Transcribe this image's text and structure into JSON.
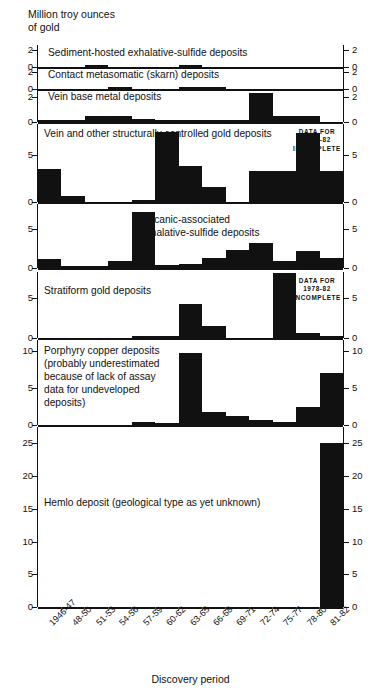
{
  "header": {
    "axis_title": "Million troy ounces\nof gold"
  },
  "xaxis": {
    "title": "Discovery period",
    "categories": [
      "1946-47",
      "48-50",
      "51-53",
      "54-56",
      "57-59",
      "60-62",
      "63-65",
      "66-68",
      "69-71",
      "72-74",
      "75-77",
      "78-80",
      "81-82"
    ]
  },
  "notes": {
    "incomplete": "DATA FOR\n1978-82\nINCOMPLETE"
  },
  "chart_data": {
    "type": "bar",
    "xlabel": "Discovery period",
    "ylabel": "Million troy ounces of gold",
    "grid": false,
    "legend": "none",
    "categories": [
      "1946-47",
      "48-50",
      "51-53",
      "54-56",
      "57-59",
      "60-62",
      "63-65",
      "66-68",
      "69-71",
      "72-74",
      "75-77",
      "78-80",
      "81-82"
    ],
    "panels": [
      {
        "name": "sediment-hosted",
        "label": "Sediment-hosted exhalative-sulfide deposits",
        "ylim": [
          0,
          2.6
        ],
        "yticks": [
          0,
          2
        ],
        "values": [
          0,
          0,
          0.12,
          0,
          0,
          0,
          0.2,
          0,
          0,
          0,
          0,
          0,
          0
        ],
        "incomplete_note": false
      },
      {
        "name": "contact-metasomatic",
        "label": "Contact metasomatic (skarn) deposits",
        "ylim": [
          0,
          2.6
        ],
        "yticks": [
          0,
          2
        ],
        "values": [
          0,
          0,
          0,
          0.2,
          0,
          0,
          0.06,
          0.06,
          0,
          0,
          0,
          0,
          0
        ],
        "incomplete_note": false
      },
      {
        "name": "vein-base-metal",
        "label": "Vein base metal deposits",
        "ylim": [
          0,
          2.6
        ],
        "yticks": [
          0,
          2
        ],
        "values": [
          0.05,
          0.1,
          0.45,
          0.45,
          0.2,
          0.12,
          0.05,
          0.05,
          0.12,
          2.3,
          0.45,
          0.45,
          0
        ],
        "incomplete_note": false
      },
      {
        "name": "vein-structural-gold",
        "label": "Vein and other structurally controlled gold deposits",
        "ylim": [
          0,
          8.3
        ],
        "yticks": [
          0,
          5
        ],
        "values": [
          3.5,
          0.6,
          0.0,
          0.0,
          0.15,
          7.4,
          3.8,
          1.6,
          0.0,
          3.3,
          3.3,
          7.3,
          3.3
        ],
        "incomplete_note": true
      },
      {
        "name": "volcanic-associated",
        "label": "Volcanic-associated\nexhalative-sulfide deposits",
        "ylim": [
          0,
          8.3
        ],
        "yticks": [
          0,
          5
        ],
        "values": [
          1.2,
          0.12,
          0.12,
          0.9,
          7.3,
          0.35,
          0.5,
          1.3,
          2.3,
          3.2,
          0.9,
          2.2,
          1.3
        ],
        "incomplete_note": false
      },
      {
        "name": "stratiform-gold",
        "label": "Stratiform gold deposits",
        "ylim": [
          0,
          8.3
        ],
        "yticks": [
          0,
          5
        ],
        "values": [
          0,
          0,
          0,
          0,
          0.1,
          0.1,
          4.3,
          1.5,
          0,
          0,
          8.2,
          0.6,
          0.1
        ],
        "incomplete_note": true
      },
      {
        "name": "porphyry-copper",
        "label": "Porphyry copper deposits\n(probably underestimated\nbecause of lack of assay\ndata for undeveloped\ndeposits)",
        "ylim": [
          0,
          11.5
        ],
        "yticks": [
          0,
          5,
          10
        ],
        "values": [
          0,
          0,
          0,
          0,
          0.35,
          0.2,
          9.8,
          1.8,
          1.2,
          0.7,
          0.35,
          2.4,
          7.1
        ],
        "incomplete_note": false
      },
      {
        "name": "hemlo",
        "label": "Hemlo deposit (geological type as yet unknown)",
        "ylim": [
          0,
          27.5
        ],
        "yticks": [
          0,
          5,
          10,
          15,
          20,
          25
        ],
        "values": [
          0,
          0,
          0,
          0,
          0,
          0,
          0,
          0,
          0,
          0,
          0,
          0,
          25
        ],
        "incomplete_note": false
      }
    ]
  }
}
